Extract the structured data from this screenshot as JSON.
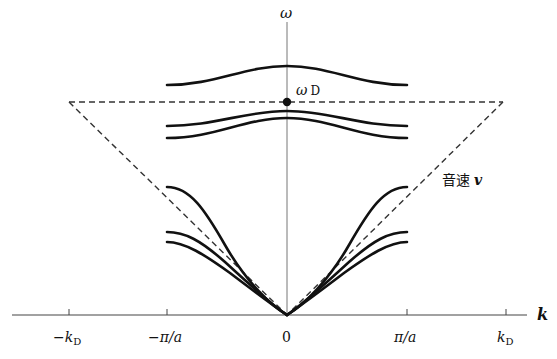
{
  "diagram": {
    "axes": {
      "x_label": "k",
      "y_label": "ω",
      "x_ticks": [
        {
          "key": "neg_kD",
          "label_main": "−k",
          "label_sub": "D",
          "value": -1.27
        },
        {
          "key": "neg_pi_a",
          "label_main": "−π/a",
          "label_sub": "",
          "value": -1.0
        },
        {
          "key": "zero",
          "label_main": "0",
          "label_sub": "",
          "value": 0
        },
        {
          "key": "pi_a",
          "label_main": "π/a",
          "label_sub": "",
          "value": 1.0
        },
        {
          "key": "kD",
          "label_main": "k",
          "label_sub": "D",
          "value": 1.27
        }
      ]
    },
    "annotations": {
      "debye_frequency": {
        "main": "ω",
        "sub": "D"
      },
      "sound_speed": {
        "jp": "音速",
        "var": "v"
      }
    },
    "branches": {
      "optical": [
        {
          "name": "optical-upper",
          "omega_center": 0.92,
          "omega_edge": 0.82
        },
        {
          "name": "optical-middle",
          "omega_center": 0.71,
          "omega_edge": 0.62
        },
        {
          "name": "optical-lower",
          "omega_center": 0.68,
          "omega_edge": 0.58
        }
      ],
      "acoustic": [
        {
          "name": "acoustic-upper",
          "omega_edge": 0.5
        },
        {
          "name": "acoustic-middle",
          "omega_edge": 0.35
        },
        {
          "name": "acoustic-lower",
          "omega_edge": 0.31
        }
      ]
    },
    "debye": {
      "omega_D": 0.75,
      "k_D": 1.27
    }
  }
}
